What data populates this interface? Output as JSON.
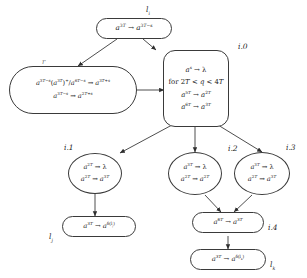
{
  "diagram": {
    "type": "flowchart",
    "title": "",
    "background_color": "#ffffff",
    "stroke_color": "#3a3a3a",
    "text_color": "#1a1a1a",
    "nodes": [
      {
        "id": "top",
        "label": "l_i",
        "label_html": "l<sub>i</sub>",
        "shape": "rounded-rectangle",
        "lines": [
          "a^{3T} → a^{3T-s}"
        ],
        "lines_html": [
          "<i class=\"v\">a</i><sup>3<i class=\"v\">T</i></sup> → <i class=\"v\">a</i><sup>3<i class=\"v\">T</i>−<i class=\"v\">s</i></sup>"
        ]
      },
      {
        "id": "left",
        "label": "r",
        "label_html": "r",
        "shape": "rounded-rectangle",
        "lines": [
          "a^{3T-s}(a^{3T})^+/a^{6T-s} → a^{3T+s}",
          "a^{3T-s} → a^{2T+s}"
        ],
        "lines_html": [
          "<i class=\"v\">a</i><sup>3<i class=\"v\">T</i>−<i class=\"v\">s</i></sup>(<i class=\"v\">a</i><sup>3<i class=\"v\">T</i></sup>)<sup>+</sup>/<i class=\"v\">a</i><sup>6<i class=\"v\">T</i>−<i class=\"v\">s</i></sup> → <i class=\"v\">a</i><sup>3<i class=\"v\">T</i>+<i class=\"v\">s</i></sup>",
          "<i class=\"v\">a</i><sup>3<i class=\"v\">T</i>−<i class=\"v\">s</i></sup> → <i class=\"v\">a</i><sup>2<i class=\"v\">T</i>+<i class=\"v\">s</i></sup>"
        ]
      },
      {
        "id": "i0",
        "label": "i.0",
        "label_html": "i.0",
        "shape": "rounded-square",
        "lines": [
          "a^s → λ",
          "for 2T < q < 4T",
          "a^{5T} → a^{2T}",
          "a^{6T} → a^{3T}"
        ],
        "lines_html": [
          "<i class=\"v\">a</i><sup><i class=\"v\">s</i></sup> → λ",
          "for 2<i class=\"v\">T</i> &lt; <i class=\"v\">q</i> &lt; 4<i class=\"v\">T</i>",
          "<i class=\"v\">a</i><sup>5<i class=\"v\">T</i></sup> → <i class=\"v\">a</i><sup>2<i class=\"v\">T</i></sup>",
          "<i class=\"v\">a</i><sup>6<i class=\"v\">T</i></sup> → <i class=\"v\">a</i><sup>3<i class=\"v\">T</i></sup>"
        ]
      },
      {
        "id": "i1",
        "label": "i.1",
        "label_html": "i.1",
        "shape": "ellipse",
        "lines": [
          "a^{2T} → λ",
          "a^{2T} → a^{3T}"
        ],
        "lines_html": [
          "<i class=\"v\">a</i><sup>2<i class=\"v\">T</i></sup> → λ",
          "<i class=\"v\">a</i><sup>2<i class=\"v\">T</i></sup> → <i class=\"v\">a</i><sup>3<i class=\"v\">T</i></sup>"
        ]
      },
      {
        "id": "i2",
        "label": "i.2",
        "label_html": "i.2",
        "shape": "ellipse",
        "lines": [
          "a^{3T} → λ",
          "a^{2T} → a^{2T}"
        ],
        "lines_html": [
          "<i class=\"v\">a</i><sup>3<i class=\"v\">T</i></sup> → λ",
          "<i class=\"v\">a</i><sup>2<i class=\"v\">T</i></sup> → <i class=\"v\">a</i><sup>2<i class=\"v\">T</i></sup>"
        ]
      },
      {
        "id": "i3",
        "label": "i.3",
        "label_html": "i.3",
        "shape": "ellipse",
        "lines": [
          "a^{3T} → λ",
          "a^{2T} → a^{3T}"
        ],
        "lines_html": [
          "<i class=\"v\">a</i><sup>3<i class=\"v\">T</i></sup> → λ",
          "<i class=\"v\">a</i><sup>2<i class=\"v\">T</i></sup> → <i class=\"v\">a</i><sup>3<i class=\"v\">T</i></sup>"
        ]
      },
      {
        "id": "i4",
        "label": "i.4",
        "label_html": "i.4",
        "shape": "rounded-rectangle",
        "lines": [
          "a^{6T} → a^{3T}"
        ],
        "lines_html": [
          "<i class=\"v\">a</i><sup>6<i class=\"v\">T</i></sup> → <i class=\"v\">a</i><sup>3<i class=\"v\">T</i></sup>"
        ]
      },
      {
        "id": "lj",
        "label": "l_j",
        "label_html": "l<sub>j</sub>",
        "shape": "rounded-rectangle",
        "lines": [
          "a^{3T} → a^{δ(l_j)}"
        ],
        "lines_html": [
          "<i class=\"v\">a</i><sup>3<i class=\"v\">T</i></sup> → <i class=\"v\">a</i><sup>δ(l<sub>j</sub>)</sup>"
        ]
      },
      {
        "id": "lk",
        "label": "l_k",
        "label_html": "l<sub>k</sub>",
        "shape": "rounded-rectangle",
        "lines": [
          "a^{3T} → a^{δ(l_k)}"
        ],
        "lines_html": [
          "<i class=\"v\">a</i><sup>3<i class=\"v\">T</i></sup> → <i class=\"v\">a</i><sup>δ(l<sub>k</sub>)</sup>"
        ]
      }
    ],
    "edges": [
      {
        "from": "top",
        "to": "left"
      },
      {
        "from": "top",
        "to": "i0"
      },
      {
        "from": "left",
        "to": "i0"
      },
      {
        "from": "i0",
        "to": "i1"
      },
      {
        "from": "i0",
        "to": "i2"
      },
      {
        "from": "i0",
        "to": "i3"
      },
      {
        "from": "i1",
        "to": "lj"
      },
      {
        "from": "i2",
        "to": "i4"
      },
      {
        "from": "i3",
        "to": "i4"
      },
      {
        "from": "i4",
        "to": "lk"
      }
    ]
  }
}
